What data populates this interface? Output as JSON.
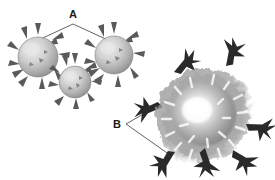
{
  "figure": {
    "background_color": "#ffffff",
    "width": 275,
    "height": 180,
    "type": "scientific-micrograph-illustration"
  },
  "labels": [
    {
      "id": "A",
      "text": "A",
      "x": 73,
      "y": 18,
      "points_to": "small-spiky-cells",
      "leader_style": "two-branch-inverted-v"
    },
    {
      "id": "B",
      "text": "B",
      "x": 117,
      "y": 128,
      "points_to": "large-cell-spikes",
      "leader_style": "two-branch-right-chevron"
    }
  ],
  "small_cells": {
    "group_name": "small-spiky-cells",
    "count": 3,
    "body_color": "#b8b8b8",
    "highlight_color": "#e6e6e6",
    "spike_color": "#555555",
    "items": [
      {
        "name": "cell-left",
        "cx": 38,
        "cy": 57,
        "r": 20,
        "spikes": 11
      },
      {
        "name": "cell-right",
        "cx": 114,
        "cy": 55,
        "r": 19,
        "spikes": 11
      },
      {
        "name": "cell-bottom",
        "cx": 75,
        "cy": 82,
        "r": 16,
        "spikes": 10
      }
    ]
  },
  "large_cell": {
    "name": "large-fuzzy-cell-mass",
    "cx": 206,
    "cy": 118,
    "core_radius": 24,
    "corona_radius": 54,
    "center_color": "#fdfdfd",
    "corona_color": "#8d8d8d",
    "spike_color": "#2b2b2b",
    "spike_count": 7,
    "spikes": [
      {
        "name": "spike-top-left",
        "angle": 226,
        "length": 30
      },
      {
        "name": "spike-top-right",
        "angle": 288,
        "length": 28
      },
      {
        "name": "spike-left",
        "angle": 172,
        "length": 30
      },
      {
        "name": "spike-right",
        "angle": 12,
        "length": 30
      },
      {
        "name": "spike-lower-right",
        "angle": 44,
        "length": 28
      },
      {
        "name": "spike-lower-left",
        "angle": 140,
        "length": 28
      },
      {
        "name": "spike-bottom",
        "angle": 80,
        "length": 30
      }
    ]
  },
  "leader_lines": {
    "a_apex": {
      "x": 73,
      "y": 24
    },
    "a_left_end": {
      "x": 32,
      "y": 43
    },
    "a_right_end": {
      "x": 110,
      "y": 41
    },
    "b_origin": {
      "x": 126,
      "y": 124
    },
    "b_upper_end": {
      "x": 168,
      "y": 100
    },
    "b_lower_end": {
      "x": 170,
      "y": 155
    }
  }
}
